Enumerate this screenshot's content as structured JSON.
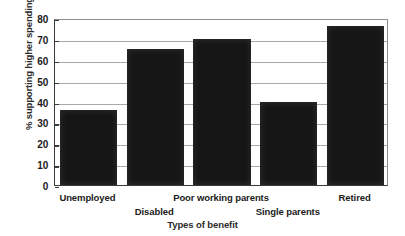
{
  "chart_data": {
    "type": "bar",
    "title": "",
    "categories": [
      "Unemployed",
      "Disabled",
      "Poor working parents",
      "Single parents",
      "Retired"
    ],
    "values": [
      36,
      65,
      70,
      40,
      76
    ],
    "xlabel": "Types of benefit",
    "ylabel": "% supporting higher spending",
    "ylim": [
      0,
      80
    ],
    "ytick_values": [
      0,
      10,
      20,
      30,
      40,
      50,
      60,
      70,
      80
    ],
    "ytick_labels": [
      "0",
      "10",
      "20",
      "30",
      "40",
      "50",
      "60",
      "70",
      "80"
    ],
    "grid": true,
    "legend": false,
    "series": [
      {
        "name": "% supporting higher spending",
        "values": [
          36,
          65,
          70,
          40,
          76
        ],
        "color": "#161616"
      }
    ]
  },
  "style": {
    "bar_color": "#161616",
    "grid_color": "#a8a8a8",
    "axis_color": "#3a3a3a",
    "background": "#ffffff",
    "text_color": "#1b1b1b"
  },
  "label_rows": [
    0,
    1,
    0,
    1,
    0
  ]
}
